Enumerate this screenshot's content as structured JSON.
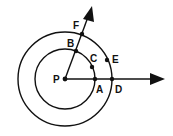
{
  "diagram": {
    "center": {
      "label": "P",
      "x": 65,
      "y": 79
    },
    "circles": [
      {
        "name": "inner-circle",
        "r": 30
      },
      {
        "name": "outer-circle",
        "r": 47
      }
    ],
    "rays": [
      {
        "name": "horizontal-ray",
        "from": "P",
        "through": [
          "A",
          "D"
        ]
      },
      {
        "name": "oblique-ray",
        "from": "P",
        "through": [
          "B",
          "F"
        ]
      }
    ],
    "points": [
      {
        "label": "P",
        "x": 65,
        "y": 79,
        "lx": 53,
        "ly": 83
      },
      {
        "label": "A",
        "x": 95,
        "y": 79,
        "lx": 96,
        "ly": 93
      },
      {
        "label": "B",
        "x": 76,
        "y": 51,
        "lx": 67,
        "ly": 47
      },
      {
        "label": "C",
        "x": 92,
        "y": 67,
        "lx": 90,
        "ly": 62
      },
      {
        "label": "D",
        "x": 112,
        "y": 79,
        "lx": 115,
        "ly": 93
      },
      {
        "label": "E",
        "x": 107,
        "y": 60,
        "lx": 112,
        "ly": 63
      },
      {
        "label": "F",
        "x": 82,
        "y": 34,
        "lx": 73,
        "ly": 29
      }
    ],
    "stroke_color": "#111111"
  }
}
